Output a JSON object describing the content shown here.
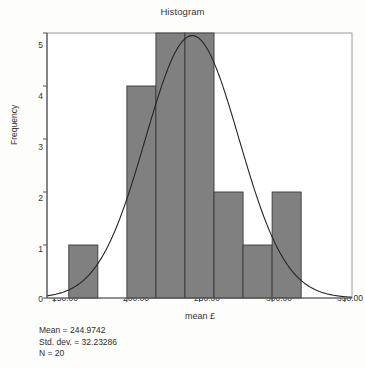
{
  "chart_data": {
    "type": "bar",
    "title": "Histogram",
    "xlabel": "mean £",
    "ylabel": "Frequency",
    "xlim": [
      145,
      355
    ],
    "ylim": [
      0,
      5
    ],
    "grid": false,
    "legend": null,
    "bin_width": 20,
    "categories": [
      "160–180",
      "200–220",
      "220–240",
      "240–260",
      "260–280",
      "280–300",
      "300–320"
    ],
    "bins": [
      {
        "start": 160,
        "end": 180,
        "value": 1
      },
      {
        "start": 200,
        "end": 220,
        "value": 4
      },
      {
        "start": 220,
        "end": 240,
        "value": 5
      },
      {
        "start": 240,
        "end": 260,
        "value": 5
      },
      {
        "start": 260,
        "end": 280,
        "value": 2
      },
      {
        "start": 280,
        "end": 300,
        "value": 1
      },
      {
        "start": 300,
        "end": 320,
        "value": 2
      }
    ],
    "values": [
      1,
      4,
      5,
      5,
      2,
      1,
      2
    ],
    "xticks": [
      150,
      200,
      250,
      300,
      350
    ],
    "xtick_labels": [
      "150.00",
      "200.00",
      "250.00",
      "300.00",
      "350.00"
    ],
    "yticks": [
      0,
      1,
      2,
      3,
      4,
      5
    ],
    "ytick_labels": [
      "0",
      "1",
      "2",
      "3",
      "4",
      "5"
    ],
    "overlay_curve": {
      "name": "normal-distribution-curve",
      "mean": 244.9742,
      "std_dev": 32.23286,
      "n": 20,
      "bin_width": 20
    },
    "colors": {
      "bar_fill": "#808080",
      "bar_edge": "#3a3a3a",
      "curve": "#262626",
      "axis": "#555555",
      "frame": "#9a9a9a",
      "background": "#fdfdfc",
      "text": "#2b2b2b"
    }
  },
  "statistics": {
    "mean_label": "Mean = 244.9742",
    "std_dev_label": "Std. dev. = 32.23286",
    "n_label": "N = 20"
  }
}
